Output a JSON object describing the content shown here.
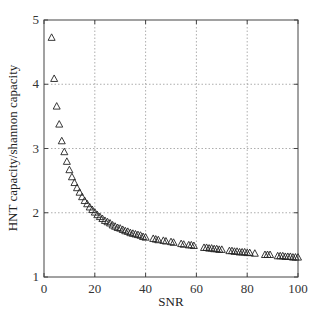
{
  "chart_data": {
    "type": "scatter",
    "title": "",
    "xlabel": "SNR",
    "ylabel": "HNT capacity/shannon capacity",
    "xlim": [
      0,
      100
    ],
    "ylim": [
      1,
      5
    ],
    "xticks": [
      0,
      20,
      40,
      60,
      80,
      100
    ],
    "yticks": [
      1,
      2,
      3,
      4,
      5
    ],
    "grid": true,
    "legend": null,
    "marker": "triangle-open",
    "series": [
      {
        "name": "HNT capacity/shannon capacity",
        "x": [
          3,
          4,
          5,
          6,
          7,
          8,
          9,
          10,
          11,
          12,
          13,
          14,
          15,
          16,
          17,
          18,
          19,
          20,
          21,
          22,
          23,
          24,
          25,
          26,
          27,
          28,
          29,
          30,
          31,
          32,
          33,
          34,
          35,
          36,
          37,
          38,
          39,
          40,
          43,
          44,
          45,
          47,
          48,
          50,
          51,
          54,
          55,
          57,
          58,
          59,
          63,
          64,
          65,
          66,
          67,
          68,
          69,
          70,
          73,
          74,
          75,
          76,
          77,
          78,
          79,
          80,
          81,
          83,
          87,
          88,
          89,
          92,
          93,
          94,
          95,
          96,
          97,
          98,
          99,
          100
        ],
        "y": [
          4.73,
          4.09,
          3.66,
          3.38,
          3.12,
          2.95,
          2.8,
          2.67,
          2.56,
          2.47,
          2.39,
          2.32,
          2.25,
          2.19,
          2.14,
          2.09,
          2.05,
          2.01,
          1.97,
          1.94,
          1.91,
          1.88,
          1.86,
          1.84,
          1.81,
          1.79,
          1.77,
          1.76,
          1.74,
          1.72,
          1.71,
          1.69,
          1.68,
          1.67,
          1.66,
          1.65,
          1.63,
          1.62,
          1.6,
          1.59,
          1.58,
          1.57,
          1.56,
          1.55,
          1.54,
          1.52,
          1.51,
          1.5,
          1.5,
          1.49,
          1.46,
          1.46,
          1.45,
          1.45,
          1.44,
          1.44,
          1.43,
          1.43,
          1.41,
          1.41,
          1.4,
          1.4,
          1.39,
          1.39,
          1.39,
          1.38,
          1.38,
          1.37,
          1.35,
          1.35,
          1.35,
          1.33,
          1.33,
          1.33,
          1.32,
          1.32,
          1.32,
          1.31,
          1.31,
          1.31
        ]
      }
    ]
  }
}
